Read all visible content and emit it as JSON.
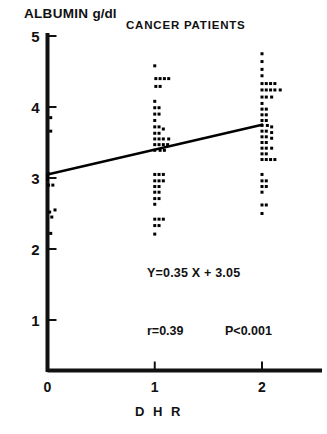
{
  "figure": {
    "title": "CANCER PATIENTS",
    "y_axis_title_main": "ALBUMIN",
    "y_axis_title_unit": "g/dl",
    "x_axis_title": "D H R"
  },
  "annotations": {
    "equation": "Y=0.35 X + 3.05",
    "correlation": "r=0.39",
    "pvalue": "P<0.001"
  },
  "axis_labels": {
    "y": [
      "5",
      "4",
      "3",
      "2",
      "1"
    ],
    "x": [
      "0",
      "1",
      "2"
    ]
  },
  "chart_data": {
    "type": "scatter",
    "title": "CANCER PATIENTS",
    "xlabel": "DHR",
    "ylabel": "ALBUMIN g/dl",
    "xlim": [
      0,
      2.35
    ],
    "ylim": [
      0,
      5
    ],
    "yticks": [
      1,
      2,
      3,
      4,
      5
    ],
    "xticks": [
      0,
      1,
      2
    ],
    "grid": false,
    "legend": null,
    "marker": "square-dot",
    "marker_color": "#000000",
    "regression": {
      "slope": 0.35,
      "intercept": 3.05,
      "r": 0.39,
      "p_text": "P<0.001",
      "x_start": 0.0,
      "y_start": 3.05,
      "x_end": 2.0,
      "y_end": 3.75,
      "color": "#000000"
    },
    "groups": [
      {
        "x": 0,
        "n": 10,
        "points": [
          [
            0.03,
            3.85
          ],
          [
            0.03,
            3.66
          ],
          [
            0.0,
            3.02
          ],
          [
            0.01,
            3.06
          ],
          [
            0.0,
            2.98
          ],
          [
            0.01,
            2.9
          ],
          [
            0.05,
            2.9
          ],
          [
            0.02,
            2.52
          ],
          [
            0.07,
            2.55
          ],
          [
            0.04,
            2.45
          ],
          [
            0.03,
            2.22
          ]
        ]
      },
      {
        "x": 1,
        "n": 50,
        "points": [
          [
            1.0,
            4.58
          ],
          [
            1.01,
            4.4
          ],
          [
            1.05,
            4.4
          ],
          [
            1.09,
            4.4
          ],
          [
            1.13,
            4.4
          ],
          [
            1.01,
            4.29
          ],
          [
            1.05,
            4.29
          ],
          [
            1.0,
            4.08
          ],
          [
            1.0,
            3.99
          ],
          [
            1.04,
            3.99
          ],
          [
            1.0,
            3.9
          ],
          [
            1.04,
            3.9
          ],
          [
            1.0,
            3.81
          ],
          [
            1.0,
            3.72
          ],
          [
            1.04,
            3.72
          ],
          [
            1.08,
            3.69
          ],
          [
            1.0,
            3.63
          ],
          [
            1.04,
            3.63
          ],
          [
            1.0,
            3.55
          ],
          [
            1.04,
            3.55
          ],
          [
            1.08,
            3.55
          ],
          [
            1.13,
            3.55
          ],
          [
            1.0,
            3.47
          ],
          [
            1.04,
            3.47
          ],
          [
            1.08,
            3.47
          ],
          [
            1.12,
            3.47
          ],
          [
            1.0,
            3.39
          ],
          [
            1.05,
            3.39
          ],
          [
            1.09,
            3.39
          ],
          [
            1.0,
            3.05
          ],
          [
            1.04,
            3.05
          ],
          [
            1.08,
            3.05
          ],
          [
            1.0,
            2.96
          ],
          [
            1.04,
            2.96
          ],
          [
            1.08,
            2.96
          ],
          [
            1.0,
            2.88
          ],
          [
            1.04,
            2.88
          ],
          [
            1.0,
            2.8
          ],
          [
            1.04,
            2.8
          ],
          [
            1.0,
            2.71
          ],
          [
            1.04,
            2.71
          ],
          [
            1.0,
            2.63
          ],
          [
            1.0,
            2.42
          ],
          [
            1.04,
            2.42
          ],
          [
            1.08,
            2.42
          ],
          [
            1.0,
            2.33
          ],
          [
            1.04,
            2.33
          ],
          [
            1.0,
            2.21
          ]
        ]
      },
      {
        "x": 2,
        "n": 65,
        "points": [
          [
            2.0,
            4.75
          ],
          [
            2.0,
            4.64
          ],
          [
            2.0,
            4.53
          ],
          [
            2.0,
            4.44
          ],
          [
            2.0,
            4.33
          ],
          [
            2.04,
            4.33
          ],
          [
            2.08,
            4.33
          ],
          [
            2.12,
            4.33
          ],
          [
            2.0,
            4.24
          ],
          [
            2.04,
            4.24
          ],
          [
            2.08,
            4.24
          ],
          [
            2.12,
            4.24
          ],
          [
            2.17,
            4.24
          ],
          [
            2.0,
            4.14
          ],
          [
            2.04,
            4.14
          ],
          [
            2.09,
            4.14
          ],
          [
            2.0,
            4.05
          ],
          [
            2.0,
            3.97
          ],
          [
            2.04,
            3.97
          ],
          [
            2.0,
            3.89
          ],
          [
            2.04,
            3.89
          ],
          [
            2.0,
            3.81
          ],
          [
            2.04,
            3.81
          ],
          [
            2.0,
            3.74
          ],
          [
            2.05,
            3.74
          ],
          [
            2.09,
            3.72
          ],
          [
            2.0,
            3.66
          ],
          [
            2.04,
            3.66
          ],
          [
            2.09,
            3.64
          ],
          [
            2.0,
            3.58
          ],
          [
            2.04,
            3.58
          ],
          [
            2.09,
            3.56
          ],
          [
            2.0,
            3.5
          ],
          [
            2.04,
            3.5
          ],
          [
            2.0,
            3.42
          ],
          [
            2.04,
            3.42
          ],
          [
            2.09,
            3.42
          ],
          [
            2.0,
            3.34
          ],
          [
            2.04,
            3.34
          ],
          [
            2.0,
            3.26
          ],
          [
            2.04,
            3.26
          ],
          [
            2.08,
            3.26
          ],
          [
            2.12,
            3.26
          ],
          [
            2.0,
            3.05
          ],
          [
            2.0,
            2.96
          ],
          [
            2.04,
            2.96
          ],
          [
            2.0,
            2.88
          ],
          [
            2.04,
            2.88
          ],
          [
            2.0,
            2.8
          ],
          [
            2.0,
            2.62
          ],
          [
            2.04,
            2.62
          ],
          [
            2.0,
            2.5
          ]
        ]
      }
    ]
  }
}
